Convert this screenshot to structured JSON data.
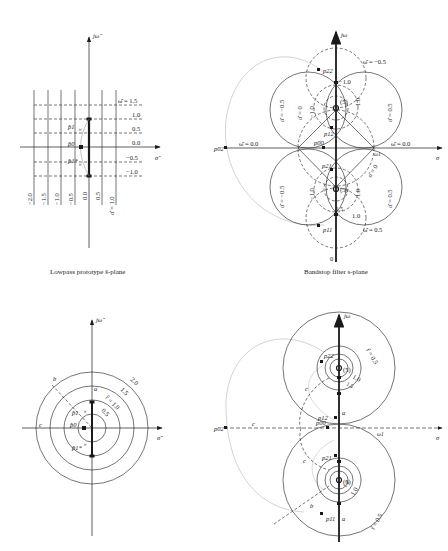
{
  "panels": {
    "top_left": {
      "caption": "Lowpass prototype ŝ-plane",
      "axis_vertical": "jω̂",
      "axis_horizontal": "σ̂",
      "omega_labels": [
        "ω̂ = 1.5",
        "1.0",
        "0.5",
        "0.0",
        "−0.5",
        "−1.0"
      ],
      "sigma_labels": [
        "−2.0",
        "−1.5",
        "−1.0",
        "−0.5",
        "0.0",
        "0.5",
        "σ̂ = 1.0"
      ],
      "poles": [
        "p̂1",
        "p̂0",
        "p̂1*"
      ]
    },
    "top_right": {
      "caption": "Bandstop filter s-plane",
      "axis_vertical": "jω",
      "axis_horizontal": "σ",
      "labels": {
        "omega_top": "ω̂ = −0.5",
        "omega_bottom": "ω̂ = 0.5",
        "omega_left": "ω̂ = 0.0",
        "omega_right": "ω̂ = 0.0",
        "sigma_left_top": "σ̂ = −0.5",
        "sigma_left_bottom": "σ̂ = −0.5",
        "sigma_right_top": "σ̂ = 0.5",
        "sigma_right_bottom": "σ̂ = 0.5",
        "sigma_zero_top": "σ̂ = 0",
        "sigma_zero_bottom": "σ̂ = 0",
        "minus_one_top": "−1.0",
        "minus_one_left_top": "−1.0",
        "one_right_top": "1.0",
        "minus_one_left_bottom": "−1.0",
        "one_right_bottom": "1.0",
        "one_bottom": "1.0",
        "one_five_bottom": "1.5",
        "zero_count_top": "(5)",
        "zero_count_bottom": "(5)",
        "w1": "ω1",
        "origin": "0"
      },
      "poles": [
        "p22",
        "p12",
        "p00",
        "p21",
        "p11",
        "p02"
      ]
    },
    "bottom_left": {
      "axis_vertical": "jω̂",
      "axis_horizontal": "σ̂",
      "radius_labels": [
        "2.0",
        "1.5",
        "r̂ = 1.0",
        "0.5"
      ],
      "path_labels": [
        "a",
        "b",
        "c"
      ],
      "poles": [
        "p̂1",
        "p̂0",
        "p̂1*"
      ]
    },
    "bottom_right": {
      "axis_vertical": "jω",
      "axis_horizontal": "σ",
      "radius_labels_top": [
        "r̂ = 0.5",
        "1.0",
        "1.5"
      ],
      "radius_labels_bottom": [
        "1.5",
        "1.0",
        "r̂ = 0.5"
      ],
      "zero_count_top": "(5)",
      "zero_count_bottom": "(5)",
      "path_labels": [
        "a",
        "a",
        "b",
        "c",
        "c",
        "c"
      ],
      "w1": "ω1",
      "poles": [
        "p22",
        "p12",
        "p00",
        "p21",
        "p11",
        "p02"
      ]
    }
  },
  "colors": {
    "ink": "#1a1a1a",
    "grey_curve": "#b5b5b5",
    "background": "#ffffff"
  }
}
